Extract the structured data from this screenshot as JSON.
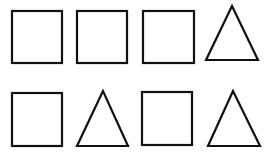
{
  "figure": {
    "background": "#ffffff",
    "stroke_color": "#111111",
    "rows": [
      {
        "shapes": [
          {
            "type": "square",
            "x": 12,
            "y": 11,
            "w": 50,
            "h": 52
          },
          {
            "type": "square",
            "x": 77,
            "y": 11,
            "w": 50,
            "h": 52
          },
          {
            "type": "square",
            "x": 143,
            "y": 11,
            "w": 51,
            "h": 52
          },
          {
            "type": "triangle",
            "points": "232,6 206,60 258,60"
          }
        ]
      },
      {
        "shapes": [
          {
            "type": "square",
            "x": 12,
            "y": 93,
            "w": 50,
            "h": 53
          },
          {
            "type": "triangle",
            "points": "103,91 77,146 128,146"
          },
          {
            "type": "square",
            "x": 142,
            "y": 92,
            "w": 50,
            "h": 53
          },
          {
            "type": "triangle",
            "points": "233,91 208,146 260,146"
          }
        ]
      }
    ]
  }
}
